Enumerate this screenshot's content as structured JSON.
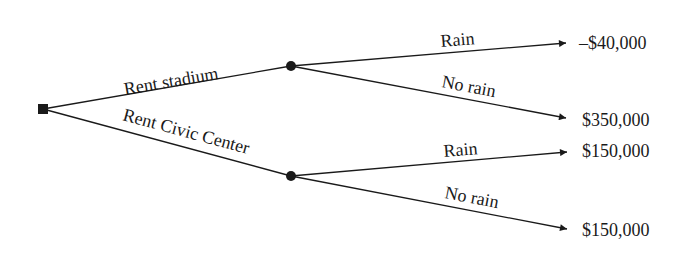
{
  "diagram": {
    "type": "decision-tree",
    "decision_node": {
      "shape": "square"
    },
    "branches": [
      {
        "label": "Rent stadium",
        "chance_node": {
          "shape": "circle"
        },
        "outcomes": [
          {
            "label": "Rain",
            "payoff": "–$40,000"
          },
          {
            "label": "No rain",
            "payoff": "$350,000"
          }
        ]
      },
      {
        "label": "Rent Civic Center",
        "chance_node": {
          "shape": "circle"
        },
        "outcomes": [
          {
            "label": "Rain",
            "payoff": "$150,000"
          },
          {
            "label": "No rain",
            "payoff": "$150,000"
          }
        ]
      }
    ]
  }
}
